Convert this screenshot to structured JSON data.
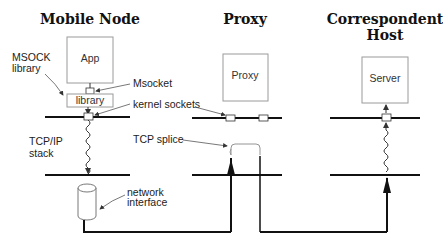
{
  "columns": [
    {
      "title_lines": [
        "Mobile Node"
      ]
    },
    {
      "title_lines": [
        "Proxy"
      ]
    },
    {
      "title_lines": [
        "Correspondent",
        "Host"
      ]
    }
  ],
  "boxes": {
    "app": "App",
    "library": "library",
    "proxy": "Proxy",
    "server": "Server"
  },
  "annotations": {
    "msock_library": [
      "MSOCK",
      "library"
    ],
    "msocket": "Msocket",
    "kernel_sockets": "kernel sockets",
    "tcp_ip_stack": [
      "TCP/IP",
      "stack"
    ],
    "tcp_splice": "TCP splice",
    "network_interface": [
      "network",
      "interface"
    ]
  },
  "colors": {
    "line": "#111111",
    "box_border": "#9a9a9a",
    "background": "#ffffff"
  }
}
